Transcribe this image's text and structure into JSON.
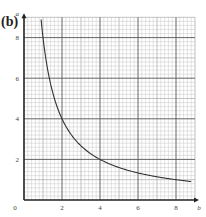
{
  "panel_label": "(b)",
  "chart_data": {
    "type": "line",
    "title": "",
    "panel": "(b)",
    "xlabel": "b",
    "ylabel": "a",
    "xlim": [
      0,
      9
    ],
    "ylim": [
      0,
      9
    ],
    "xticks": [
      0,
      2,
      4,
      6,
      8
    ],
    "yticks": [
      2,
      4,
      6,
      8
    ],
    "grid": true,
    "grid_minor_step": 0.2,
    "grid_major_step": 2,
    "series": [
      {
        "name": "curve",
        "description": "Decreasing hyperbola, approx a = 8/b",
        "x": [
          0.9,
          1,
          1.5,
          2,
          2.5,
          3,
          4,
          5,
          6,
          7,
          8,
          8.8
        ],
        "y": [
          8.9,
          8,
          5.33,
          4,
          3.2,
          2.67,
          2,
          1.6,
          1.33,
          1.14,
          1,
          0.91
        ]
      }
    ]
  }
}
